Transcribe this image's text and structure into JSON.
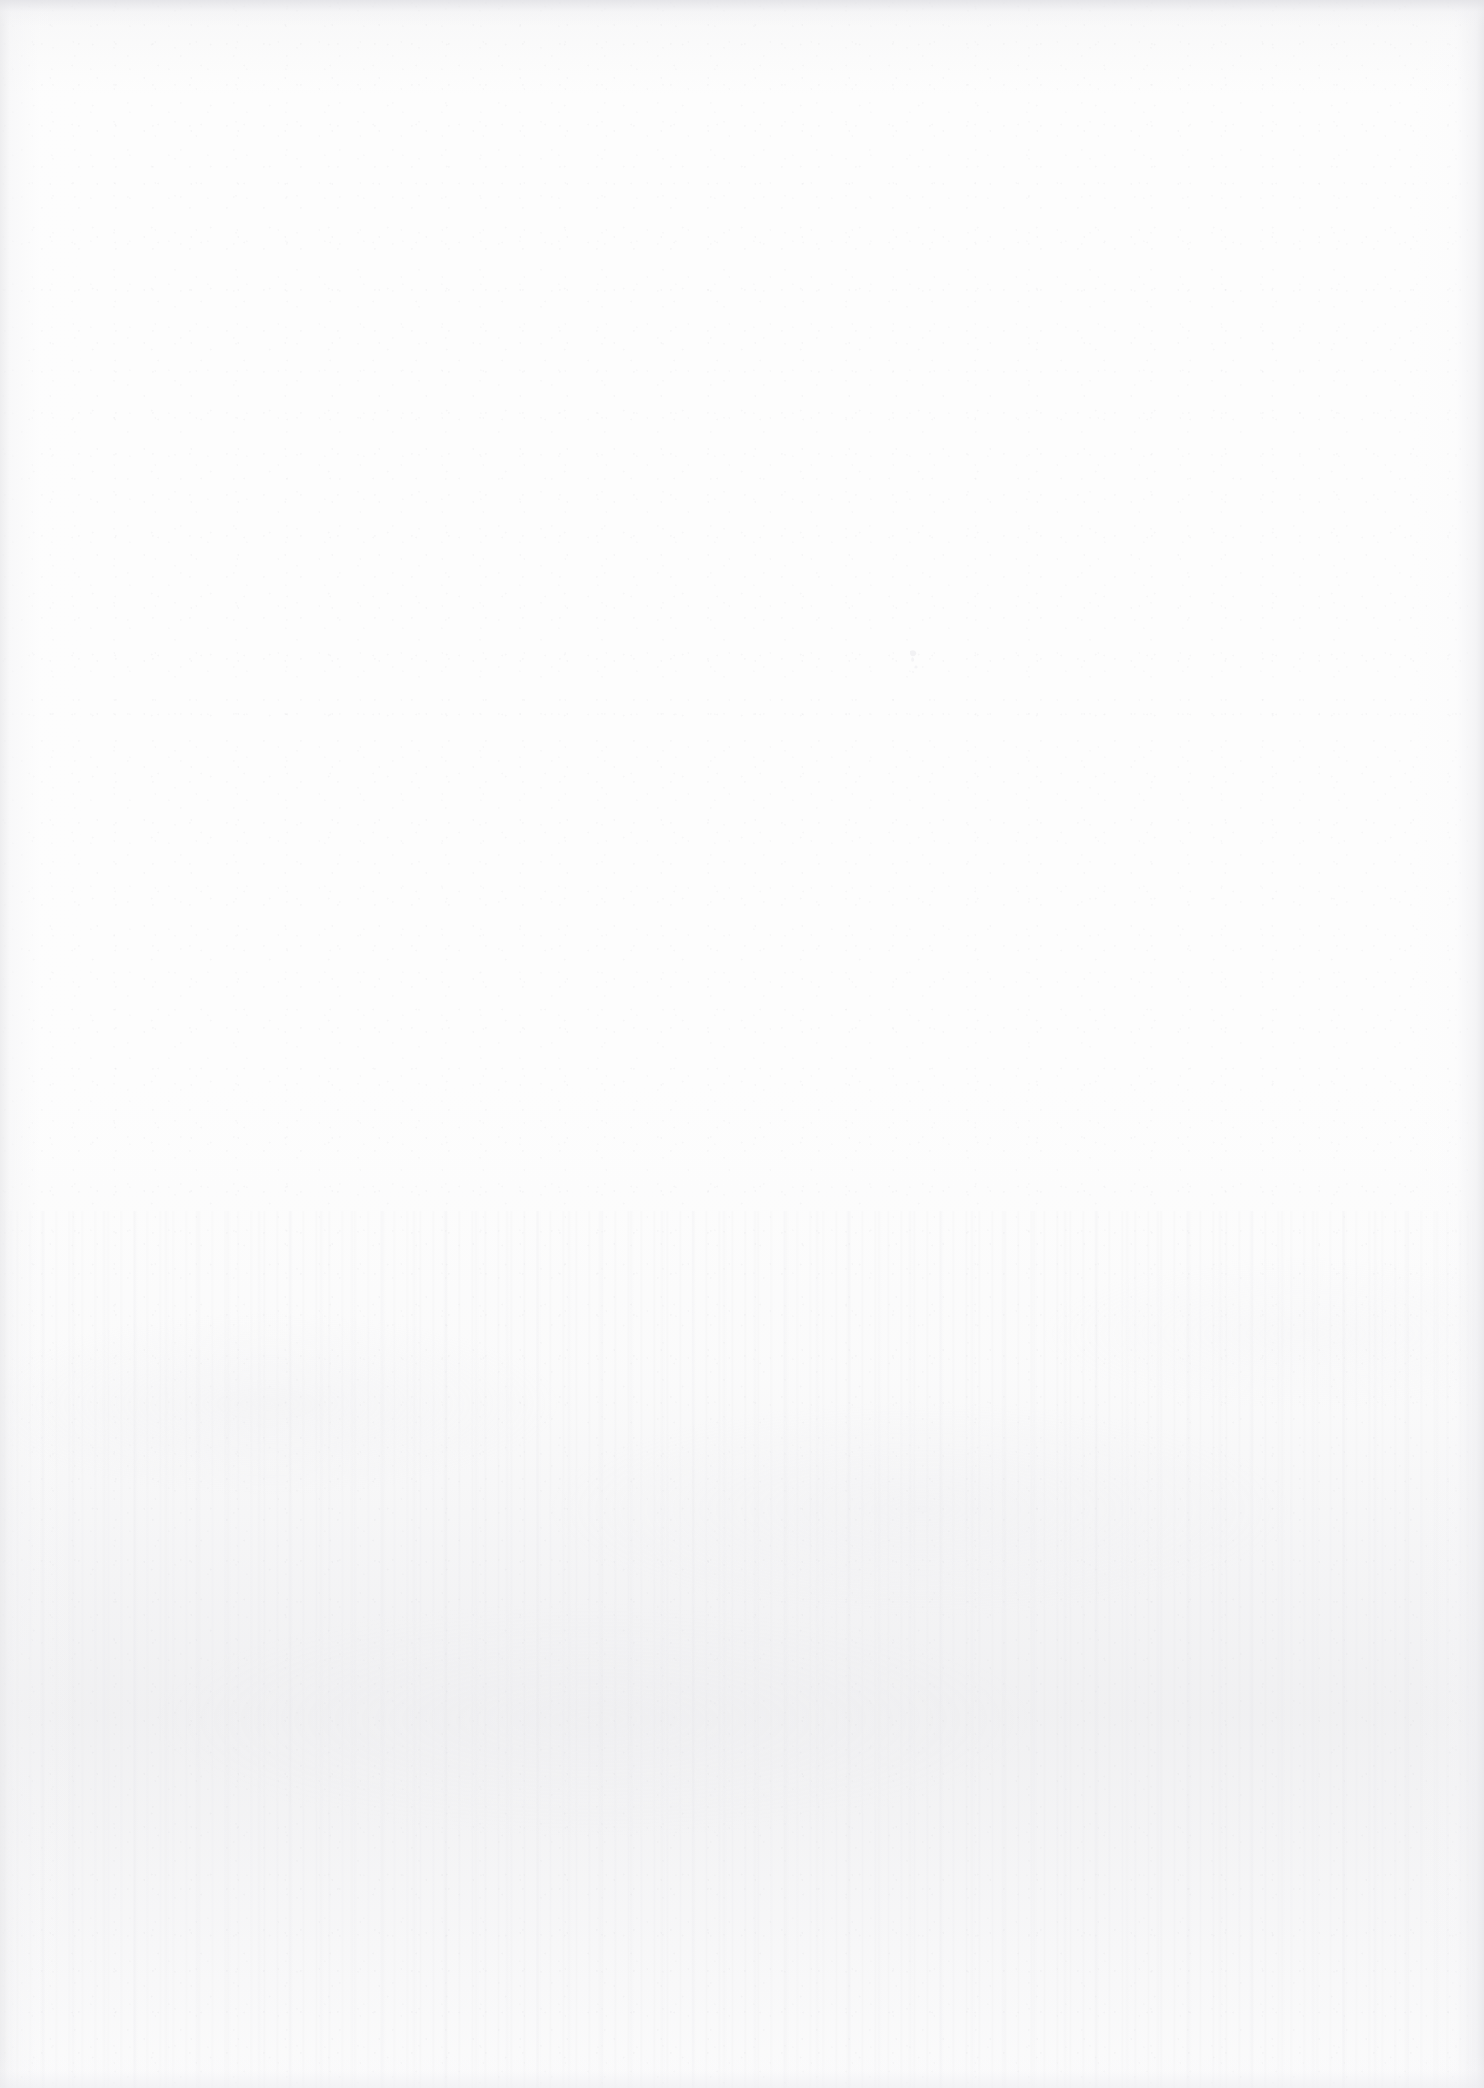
{
  "document": {
    "kind": "scanned-page",
    "page_state": "blank",
    "orientation": "portrait",
    "width_px": 1484,
    "height_px": 2088,
    "visible_text": "",
    "text_blocks": [],
    "headings": [],
    "page_number": "",
    "caption": "",
    "notes": ""
  },
  "appearance": {
    "paper_color": "#fdfdfd",
    "base_white": "#ffffff",
    "grain_tone": "#c6c6cc",
    "shadow_tone": "#e7e7ea",
    "edge_tone": "#eaeaec",
    "top_edge_tone": "#e2e2e6",
    "mottle_tone": "#e5e5ea",
    "speck_tone": "#f2f2f4"
  },
  "artifacts": {
    "top_edge_shadow": {
      "name": "top-edge-shadow",
      "description": "narrow darker strip along the top border of the scan"
    },
    "bottom_edge_shadow": {
      "name": "bottom-edge-shadow",
      "description": "faint darker strip along the bottom border of the scan"
    },
    "left_edge_band": {
      "name": "left-edge-band",
      "description": "soft vertical darkening along the left margin"
    },
    "right_edge_band": {
      "name": "right-edge-band",
      "description": "soft vertical darkening along the right margin"
    },
    "lower_mottle": {
      "name": "lower-third-mottle",
      "description": "denser grain and faint vertical streaking across the lower third"
    },
    "speck": {
      "name": "paper-speck",
      "description": "tiny pale mark in the upper-right quadrant",
      "x": 910,
      "y": 660
    }
  }
}
